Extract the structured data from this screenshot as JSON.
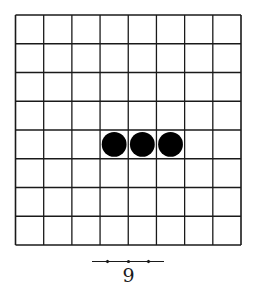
{
  "figure": {
    "caption_number": "9",
    "board": {
      "columns": 8,
      "rows": 8,
      "left": 15.5,
      "top": 15,
      "right": 241,
      "bottom": 245,
      "line_color": "#1a1a1a",
      "background": "#ffffff"
    },
    "stones": [
      {
        "color": "black",
        "col": 3,
        "row": 4
      },
      {
        "color": "black",
        "col": 4,
        "row": 4
      },
      {
        "color": "black",
        "col": 5,
        "row": 4
      }
    ],
    "stone_color": "#000000"
  }
}
